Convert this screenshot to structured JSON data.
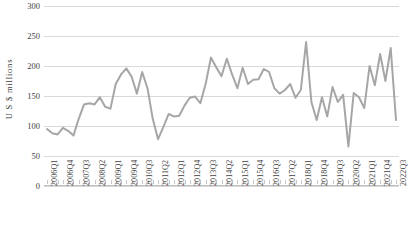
{
  "chart_data": {
    "type": "line",
    "title": "",
    "xlabel": "",
    "ylabel": "U S $ millions",
    "ylim": [
      0,
      300
    ],
    "ytick_step": 50,
    "yticks": [
      0,
      50,
      100,
      150,
      200,
      250,
      300
    ],
    "ytick_labels": [
      "0",
      "50",
      "100",
      "150",
      "200",
      "250",
      "300"
    ],
    "grid": true,
    "legend": false,
    "legend_position": "none",
    "line_color": "#a6a6a6",
    "line_width": 2,
    "categories": [
      "2006Q1",
      "2006Q2",
      "2006Q3",
      "2006Q4",
      "2007Q1",
      "2007Q2",
      "2007Q3",
      "2007Q4",
      "2008Q1",
      "2008Q2",
      "2008Q3",
      "2008Q4",
      "2009Q1",
      "2009Q2",
      "2009Q3",
      "2009Q4",
      "2010Q1",
      "2010Q2",
      "2010Q3",
      "2010Q4",
      "2011Q1",
      "2011Q2",
      "2011Q3",
      "2011Q4",
      "2012Q1",
      "2012Q2",
      "2012Q3",
      "2012Q4",
      "2013Q1",
      "2013Q2",
      "2013Q3",
      "2013Q4",
      "2014Q1",
      "2014Q2",
      "2014Q3",
      "2014Q4",
      "2015Q1",
      "2015Q2",
      "2015Q3",
      "2015Q4",
      "2016Q1",
      "2016Q2",
      "2016Q3",
      "2016Q4",
      "2017Q1",
      "2017Q2",
      "2017Q3",
      "2017Q4",
      "2018Q1",
      "2018Q2",
      "2018Q3",
      "2018Q4",
      "2019Q1",
      "2019Q2",
      "2019Q3",
      "2019Q4",
      "2020Q1",
      "2020Q2",
      "2020Q3",
      "2020Q4",
      "2021Q1",
      "2021Q2",
      "2021Q3",
      "2021Q4",
      "2022Q1",
      "2022Q2",
      "2022Q3"
    ],
    "values": [
      95,
      88,
      86,
      97,
      92,
      84,
      112,
      136,
      138,
      136,
      148,
      132,
      129,
      170,
      186,
      196,
      182,
      154,
      190,
      163,
      112,
      78,
      98,
      120,
      116,
      117,
      134,
      147,
      149,
      138,
      170,
      214,
      198,
      183,
      212,
      186,
      163,
      197,
      170,
      177,
      178,
      195,
      190,
      163,
      154,
      160,
      170,
      147,
      160,
      240,
      140,
      110,
      148,
      116,
      165,
      140,
      152,
      66,
      155,
      148,
      130,
      200,
      168,
      220,
      175,
      230,
      110
    ],
    "labeled_tick_indices": [
      0,
      3,
      6,
      9,
      12,
      15,
      18,
      21,
      24,
      27,
      30,
      33,
      36,
      39,
      42,
      45,
      48,
      51,
      54,
      57,
      60,
      63,
      66
    ],
    "labeled_tick_values": [
      "2006Q1",
      "2006Q4",
      "2007Q3",
      "2008Q2",
      "2009Q1",
      "2009Q4",
      "2010Q3",
      "2011Q2",
      "2012Q1",
      "2012Q4",
      "2013Q3",
      "2014Q2",
      "2015Q1",
      "2015Q4",
      "2016Q3",
      "2017Q2",
      "2018Q1",
      "2018Q4",
      "2019Q3",
      "2020Q2",
      "2021Q1",
      "2021Q4",
      "2022Q3"
    ]
  }
}
